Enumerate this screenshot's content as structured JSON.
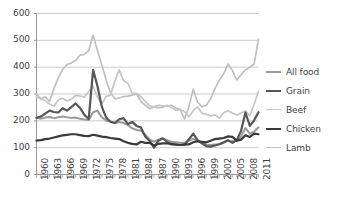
{
  "chart_data": {
    "type": "line",
    "title": "",
    "xlabel": "",
    "ylabel": "",
    "ylim": [
      0,
      600
    ],
    "ytick_values": [
      0,
      100,
      200,
      300,
      400,
      500,
      600
    ],
    "ytick_labels": [
      "0",
      "100",
      "200",
      "300",
      "400",
      "500",
      "600"
    ],
    "grid": true,
    "legend_position": "right",
    "x": [
      1960,
      1961,
      1962,
      1963,
      1964,
      1965,
      1966,
      1967,
      1968,
      1969,
      1970,
      1971,
      1972,
      1973,
      1974,
      1975,
      1976,
      1977,
      1978,
      1979,
      1980,
      1981,
      1982,
      1983,
      1984,
      1985,
      1986,
      1987,
      1988,
      1989,
      1990,
      1991,
      1992,
      1993,
      1994,
      1995,
      1996,
      1997,
      1998,
      1999,
      2000,
      2001,
      2002,
      2003,
      2004,
      2005,
      2006,
      2007,
      2008,
      2009,
      2010,
      2011
    ],
    "xtick_labels": [
      "1960",
      "1963",
      "1966",
      "1969",
      "1972",
      "1975",
      "1978",
      "1981",
      "1984",
      "1987",
      "1990",
      "1993",
      "1996",
      "1999",
      "2002",
      "2005",
      "2008",
      "2011"
    ],
    "xtick_years": [
      1960,
      1963,
      1966,
      1969,
      1972,
      1975,
      1978,
      1981,
      1984,
      1987,
      1990,
      1993,
      1996,
      1999,
      2002,
      2005,
      2008,
      2011
    ],
    "series": [
      {
        "name": "All food",
        "color": "#9a9a9a",
        "width": 2.0,
        "values": [
          212,
          208,
          212,
          214,
          210,
          213,
          216,
          213,
          211,
          212,
          208,
          205,
          203,
          232,
          238,
          213,
          200,
          198,
          192,
          196,
          192,
          184,
          172,
          166,
          164,
          148,
          130,
          122,
          130,
          133,
          128,
          122,
          120,
          118,
          118,
          125,
          133,
          126,
          118,
          112,
          110,
          112,
          113,
          118,
          126,
          124,
          126,
          142,
          173,
          152,
          160,
          176
        ]
      },
      {
        "name": "Grain",
        "color": "#565656",
        "width": 2.2,
        "values": [
          211,
          216,
          227,
          238,
          233,
          231,
          247,
          238,
          251,
          265,
          248,
          222,
          207,
          390,
          330,
          253,
          212,
          196,
          192,
          206,
          210,
          188,
          196,
          181,
          175,
          141,
          125,
          100,
          126,
          135,
          121,
          112,
          112,
          110,
          110,
          131,
          152,
          128,
          116,
          106,
          104,
          108,
          113,
          120,
          128,
          118,
          128,
          163,
          231,
          181,
          202,
          232
        ]
      },
      {
        "name": "Beef",
        "color": "#c6c6c6",
        "width": 1.7,
        "values": [
          290,
          281,
          275,
          262,
          254,
          278,
          284,
          274,
          281,
          295,
          293,
          288,
          310,
          330,
          288,
          262,
          291,
          296,
          348,
          390,
          350,
          340,
          302,
          302,
          290,
          272,
          256,
          251,
          248,
          250,
          258,
          250,
          240,
          242,
          235,
          215,
          238,
          252,
          228,
          225,
          218,
          222,
          210,
          230,
          238,
          229,
          222,
          229,
          237,
          218,
          262,
          310
        ]
      },
      {
        "name": "Chicken",
        "color": "#3a3a3a",
        "width": 2.2,
        "values": [
          126,
          128,
          132,
          134,
          138,
          142,
          146,
          148,
          150,
          150,
          147,
          144,
          143,
          148,
          145,
          141,
          139,
          136,
          134,
          132,
          124,
          118,
          114,
          112,
          122,
          118,
          118,
          108,
          114,
          116,
          116,
          114,
          111,
          110,
          112,
          112,
          120,
          124,
          122,
          120,
          126,
          132,
          134,
          136,
          142,
          140,
          126,
          130,
          146,
          140,
          152,
          150
        ]
      },
      {
        "name": "Lamb",
        "color": "#c0c0c0",
        "width": 1.7,
        "values": [
          300,
          282,
          290,
          272,
          320,
          360,
          392,
          410,
          415,
          425,
          445,
          448,
          462,
          520,
          462,
          408,
          352,
          305,
          282,
          285,
          290,
          292,
          296,
          300,
          272,
          258,
          245,
          252,
          258,
          256,
          255,
          258,
          248,
          242,
          206,
          252,
          318,
          270,
          252,
          258,
          282,
          320,
          352,
          375,
          412,
          388,
          352,
          372,
          390,
          400,
          412,
          505
        ]
      }
    ]
  },
  "legend": {
    "items": [
      {
        "label": "All food"
      },
      {
        "label": "Grain"
      },
      {
        "label": "Beef"
      },
      {
        "label": "Chicken"
      },
      {
        "label": "Lamb"
      }
    ]
  },
  "bottom_artifact": {
    "text": ""
  }
}
